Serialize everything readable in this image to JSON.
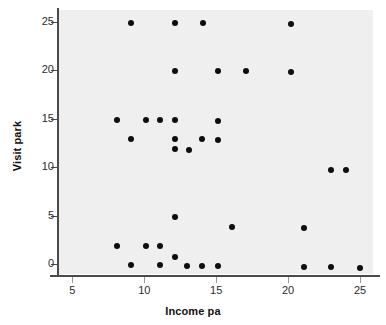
{
  "chart_data": {
    "type": "scatter",
    "title": "",
    "xlabel": "Income pa",
    "ylabel": "Visit park",
    "xlim": [
      4.0,
      25.9
    ],
    "ylim": [
      -1.0,
      26.2
    ],
    "xticks": [
      5,
      10,
      15,
      20,
      25
    ],
    "yticks": [
      0,
      5,
      10,
      15,
      20,
      25
    ],
    "xtick_labels": [
      "5",
      "10",
      "15",
      "20",
      "25"
    ],
    "ytick_labels": [
      "0",
      "5",
      "10",
      "15",
      "20",
      "25"
    ],
    "grid": false,
    "legend": null,
    "marker": "filled-circle",
    "marker_color": "#0d0d0d",
    "plot_background": "#efefef",
    "points": [
      {
        "x": 9.1,
        "y": 24.9
      },
      {
        "x": 12.1,
        "y": 24.9
      },
      {
        "x": 14.1,
        "y": 24.9
      },
      {
        "x": 20.2,
        "y": 24.8
      },
      {
        "x": 12.1,
        "y": 19.9
      },
      {
        "x": 15.1,
        "y": 19.9
      },
      {
        "x": 17.1,
        "y": 19.9
      },
      {
        "x": 20.2,
        "y": 19.8
      },
      {
        "x": 8.1,
        "y": 14.9
      },
      {
        "x": 10.1,
        "y": 14.9
      },
      {
        "x": 11.1,
        "y": 14.9
      },
      {
        "x": 12.1,
        "y": 14.9
      },
      {
        "x": 15.1,
        "y": 14.8
      },
      {
        "x": 9.1,
        "y": 12.9
      },
      {
        "x": 12.1,
        "y": 12.9
      },
      {
        "x": 14.0,
        "y": 12.9
      },
      {
        "x": 15.1,
        "y": 12.8
      },
      {
        "x": 12.1,
        "y": 11.9
      },
      {
        "x": 13.1,
        "y": 11.8
      },
      {
        "x": 23.0,
        "y": 9.7
      },
      {
        "x": 24.0,
        "y": 9.7
      },
      {
        "x": 12.1,
        "y": 4.9
      },
      {
        "x": 16.1,
        "y": 3.8
      },
      {
        "x": 21.1,
        "y": 3.7
      },
      {
        "x": 8.1,
        "y": 1.9
      },
      {
        "x": 10.1,
        "y": 1.9
      },
      {
        "x": 11.1,
        "y": 1.9
      },
      {
        "x": 12.1,
        "y": 0.8
      },
      {
        "x": 9.1,
        "y": -0.1
      },
      {
        "x": 11.1,
        "y": -0.1
      },
      {
        "x": 13.0,
        "y": -0.2
      },
      {
        "x": 14.0,
        "y": -0.2
      },
      {
        "x": 15.1,
        "y": -0.2
      },
      {
        "x": 21.1,
        "y": -0.3
      },
      {
        "x": 23.0,
        "y": -0.3
      },
      {
        "x": 25.0,
        "y": -0.4
      }
    ]
  }
}
